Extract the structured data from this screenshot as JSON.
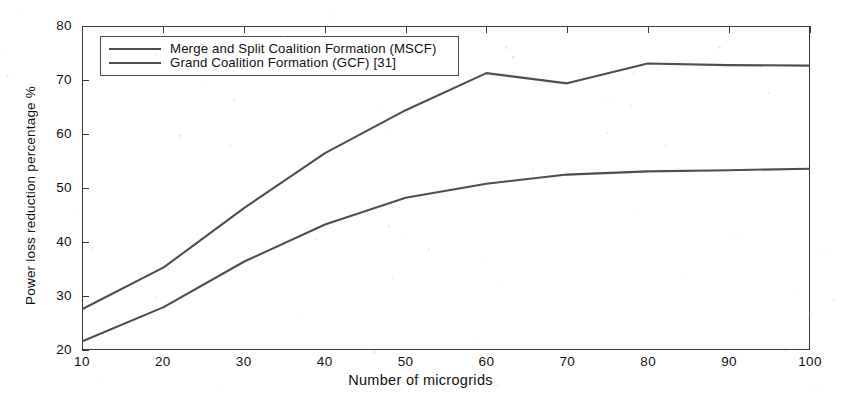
{
  "chart_data": {
    "type": "line",
    "title": "",
    "xlabel": "Number of microgrids",
    "ylabel": "Power loss reduction percentage %",
    "xlim": [
      10,
      100
    ],
    "ylim": [
      20,
      80
    ],
    "xticks": [
      10,
      20,
      30,
      40,
      50,
      60,
      70,
      80,
      90,
      100
    ],
    "yticks": [
      20,
      30,
      40,
      50,
      60,
      70,
      80
    ],
    "grid": false,
    "legend_position": "upper-left-inside",
    "x": [
      10,
      20,
      30,
      40,
      50,
      60,
      70,
      80,
      90,
      100
    ],
    "series": [
      {
        "name": "Merge and Split Coalition Formation (MSCF)",
        "color": "#4d4d52",
        "values": [
          27.5,
          35.2,
          46.3,
          56.5,
          64.5,
          71.4,
          69.5,
          73.2,
          72.9,
          72.8
        ]
      },
      {
        "name": "Grand Coalition Formation (GCF) [31]",
        "color": "#4d4d52",
        "values": [
          21.5,
          27.8,
          36.3,
          43.2,
          48.2,
          50.8,
          52.5,
          53.1,
          53.3,
          53.6
        ]
      }
    ]
  },
  "axes": {
    "xtick_labels": [
      "10",
      "20",
      "30",
      "40",
      "50",
      "60",
      "70",
      "80",
      "90",
      "100"
    ],
    "ytick_labels": [
      "20",
      "30",
      "40",
      "50",
      "60",
      "70",
      "80"
    ],
    "xlabel": "Number of microgrids",
    "ylabel": "Power loss reduction percentage %"
  },
  "legend": {
    "items": [
      {
        "label": "Merge and Split Coalition Formation (MSCF)"
      },
      {
        "label": "Grand Coalition Formation (GCF) [31]"
      }
    ]
  }
}
